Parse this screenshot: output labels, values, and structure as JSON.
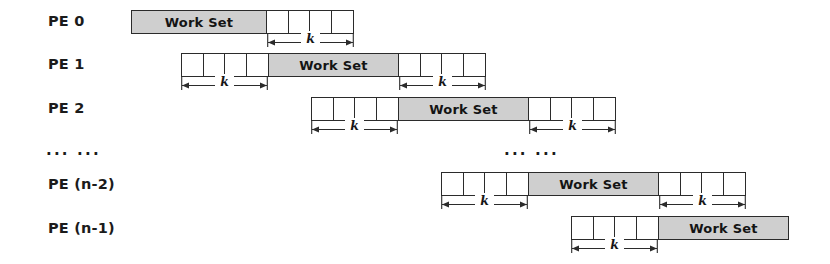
{
  "figure": {
    "workset_label": "Work Set",
    "dimension_label": "k",
    "ellipsis": "... ...",
    "center_ellipsis": "... ...",
    "colors": {
      "workset_fill": "#cfcfcf",
      "cell_fill": "#ffffff",
      "stroke": "#2b2b2b",
      "text": "#1b1b1b"
    }
  },
  "rows": [
    {
      "label": "PE 0",
      "label_x": 48,
      "label_y": 13,
      "strip_x": 131,
      "strip_y": 10,
      "left_cells": 0,
      "left_width": 0,
      "workset_width": 136,
      "right_cells": 4,
      "right_width": 87,
      "dim_left": null,
      "dim_right": {
        "x": 267,
        "y": 34,
        "width": 87
      }
    },
    {
      "label": "PE 1",
      "label_x": 48,
      "label_y": 56,
      "strip_x": 181,
      "strip_y": 53,
      "left_cells": 4,
      "left_width": 87,
      "workset_width": 131,
      "right_cells": 4,
      "right_width": 87,
      "dim_left": {
        "x": 181,
        "y": 77,
        "width": 87
      },
      "dim_right": {
        "x": 399,
        "y": 77,
        "width": 87
      }
    },
    {
      "label": "PE 2",
      "label_x": 48,
      "label_y": 100,
      "strip_x": 311,
      "strip_y": 97,
      "left_cells": 4,
      "left_width": 87,
      "workset_width": 131,
      "right_cells": 4,
      "right_width": 87,
      "dim_left": {
        "x": 311,
        "y": 121,
        "width": 87
      },
      "dim_right": {
        "x": 529,
        "y": 121,
        "width": 87
      }
    },
    {
      "label": "... ...",
      "label_x": 46,
      "label_y": 141,
      "is_ellipsis": true
    },
    {
      "label": "PE (n-2)",
      "label_x": 48,
      "label_y": 176,
      "strip_x": 441,
      "strip_y": 172,
      "left_cells": 4,
      "left_width": 87,
      "workset_width": 131,
      "right_cells": 4,
      "right_width": 87,
      "dim_left": {
        "x": 441,
        "y": 196,
        "width": 87
      },
      "dim_right": {
        "x": 659,
        "y": 196,
        "width": 87
      }
    },
    {
      "label": "PE (n-1)",
      "label_x": 48,
      "label_y": 220,
      "strip_x": 571,
      "strip_y": 216,
      "left_cells": 4,
      "left_width": 87,
      "workset_width": 131,
      "right_cells": 0,
      "right_width": 0,
      "dim_left": {
        "x": 571,
        "y": 240,
        "width": 87
      },
      "dim_right": null
    }
  ],
  "center_ellipsis_pos": {
    "x": 504,
    "y": 141
  }
}
